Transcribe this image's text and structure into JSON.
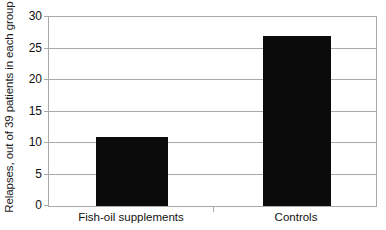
{
  "chart_data": {
    "type": "bar",
    "title": "",
    "subtitle": "",
    "xlabel": "",
    "ylabel": "Relapses, out of 39 patients in each group",
    "categories": [
      "Fish-oil supplements",
      "Controls"
    ],
    "values": [
      11,
      27
    ],
    "ylim": [
      0,
      30
    ],
    "ytick_labels": [
      "0",
      "5",
      "10",
      "15",
      "20",
      "25",
      "30"
    ],
    "ytick_values": [
      0,
      5,
      10,
      15,
      20,
      25,
      30
    ],
    "grid": true,
    "legend": false,
    "legend_position": "none",
    "bar_color": "#0b0b0b",
    "axis_color": "#a9a9a9",
    "background_color": "#ffffff",
    "series": [
      {
        "name": "Relapses",
        "values": [
          11,
          27
        ]
      }
    ]
  }
}
